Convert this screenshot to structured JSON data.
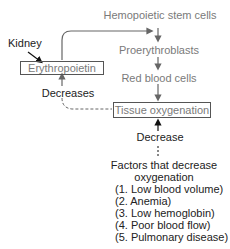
{
  "diagram": {
    "nodes": {
      "stem_cells": "Hemopoietic stem cells",
      "proerythroblasts": "Proerythroblasts",
      "red_blood_cells": "Red blood cells",
      "tissue_oxygenation": "Tissue oxygenation",
      "erythropoietin": "Erythropoietin",
      "kidney": "Kidney"
    },
    "labels": {
      "decreases": "Decreases",
      "decrease": "Decrease"
    },
    "factors": {
      "title_line1": "Factors that decrease",
      "title_line2": "oxygenation",
      "items": [
        "(1. Low blood volume)",
        "(2. Anemia)",
        "(3. Low hemoglobin)",
        "(4. Poor blood flow)",
        "(5. Pulmonary disease)"
      ]
    }
  }
}
